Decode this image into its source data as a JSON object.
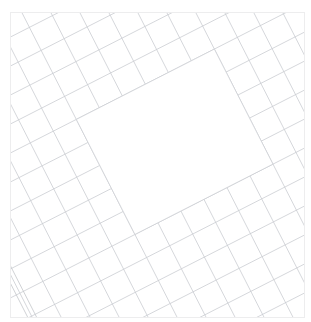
{
  "page": {
    "clipped_header_text": "",
    "attribution": ""
  },
  "map": {
    "background_color": "#ffffff",
    "frame_border_color": "#ededee",
    "street_color": "#c9ccd0",
    "avenue_color": "#c2c5c9",
    "block_fill_color": "#ffffff",
    "rotation_degrees": -27,
    "zoom_level": "",
    "center_block_label": "",
    "legend": []
  },
  "chart_data": {
    "type": "map",
    "projection": "planar",
    "rotation_degrees": -27,
    "grid": {
      "street_spacing_px": 26,
      "avenue_spacing_px": 26,
      "street_line_width_px": 0.7,
      "avenue_line_width_px": 0.7,
      "u_range": [
        -26,
        22
      ],
      "v_range": [
        -22,
        20
      ]
    },
    "wide_avenues": {
      "u_indices": [
        -7,
        9
      ],
      "v_indices": [],
      "offset_px": 4
    },
    "superblock": {
      "description": "large empty block at map center",
      "u_index_range": [
        -2,
        4
      ],
      "v_index_range": [
        -3,
        2
      ],
      "fill": "#ffffff"
    },
    "features": [
      {
        "name": "street-grid",
        "type": "polyline-set",
        "count": 90
      },
      {
        "name": "superblock",
        "type": "polygon",
        "count": 1
      },
      {
        "name": "wide-avenue",
        "type": "polyline-set",
        "count": 2
      }
    ]
  }
}
